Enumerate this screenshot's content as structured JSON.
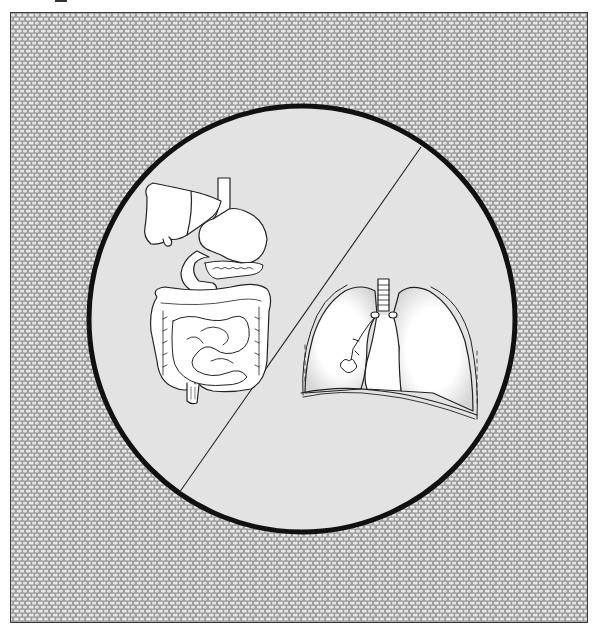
{
  "figure": {
    "panels": [
      {
        "id": "left",
        "label": "Digestive system",
        "organs": [
          "liver",
          "gallbladder",
          "esophagus",
          "stomach",
          "pancreas",
          "duodenum",
          "small intestine",
          "large intestine",
          "rectum"
        ]
      },
      {
        "id": "right",
        "label": "Respiratory system",
        "organs": [
          "trachea",
          "bronchi",
          "left lung",
          "right lung",
          "pleura",
          "diaphragm"
        ]
      }
    ]
  },
  "colors": {
    "page_background": "#ffffff",
    "texture_mesh": "#9c9c9c",
    "texture_cell": "#ececec",
    "circle_fill": "#e3e3e3",
    "circle_border": "#111111",
    "organ_fill": "#ffffff",
    "organ_stroke": "#222222"
  },
  "geometry": {
    "circle_center": [
      301,
      318
    ],
    "circle_radius": 213,
    "divider_start": [
      420,
      146
    ],
    "divider_end": [
      178,
      492
    ]
  }
}
